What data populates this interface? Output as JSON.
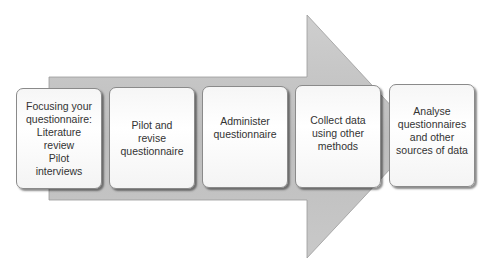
{
  "diagram": {
    "type": "process-arrow",
    "arrow_color": "#c4c4c4",
    "steps": [
      {
        "label": "Focusing your\nquestionnaire:\nLiterature\nreview\nPilot\ninterviews"
      },
      {
        "label": "Pilot and\nrevise\nquestionnaire"
      },
      {
        "label": "Administer\nquestionnaire"
      },
      {
        "label": "Collect data\nusing other\nmethods"
      },
      {
        "label": "Analyse\nquestionnaires\nand other\nsources of data"
      }
    ]
  }
}
